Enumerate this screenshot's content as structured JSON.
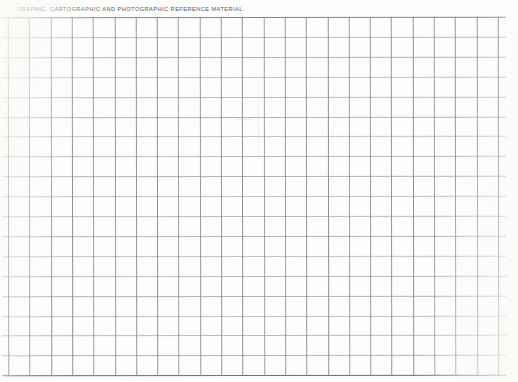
{
  "document": {
    "type": "scanned-blank-form",
    "header_caption": "GRAPHIC, CARTOGRAPHIC AND PHOTOGRAPHIC REFERENCE MATERIAL.",
    "page_width": 518,
    "page_height": 382,
    "background_color": "#fdfdfc"
  },
  "grid": {
    "columns": 23,
    "rows": 18,
    "column_width": 21.3,
    "row_height": 19.9,
    "left": 8,
    "top": 17,
    "right": 497,
    "bottom": 375,
    "rule_color_vertical": "#8a8a88",
    "rule_color_horizontal": "#a9a9a6",
    "rule_color_border": "#6d6d6b",
    "cell_values": []
  },
  "colors": {
    "paper": "#fdfdfc",
    "ink_text": "#4a4a4a",
    "rule_light": "#a9a9a6",
    "rule_dark": "#7b7b79"
  }
}
